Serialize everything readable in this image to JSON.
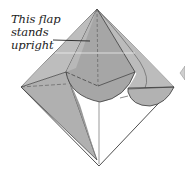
{
  "diagram": {
    "type": "origami-fold-step",
    "annotation": {
      "lines": [
        "This flap",
        "stands",
        "upright"
      ]
    },
    "colors": {
      "paper_gray": "#b4b4b4",
      "paper_light": "#c8c8c8",
      "flap_dark": "#a3a3a3",
      "paper_white": "#ffffff",
      "outline": "#3a3a3a"
    }
  }
}
